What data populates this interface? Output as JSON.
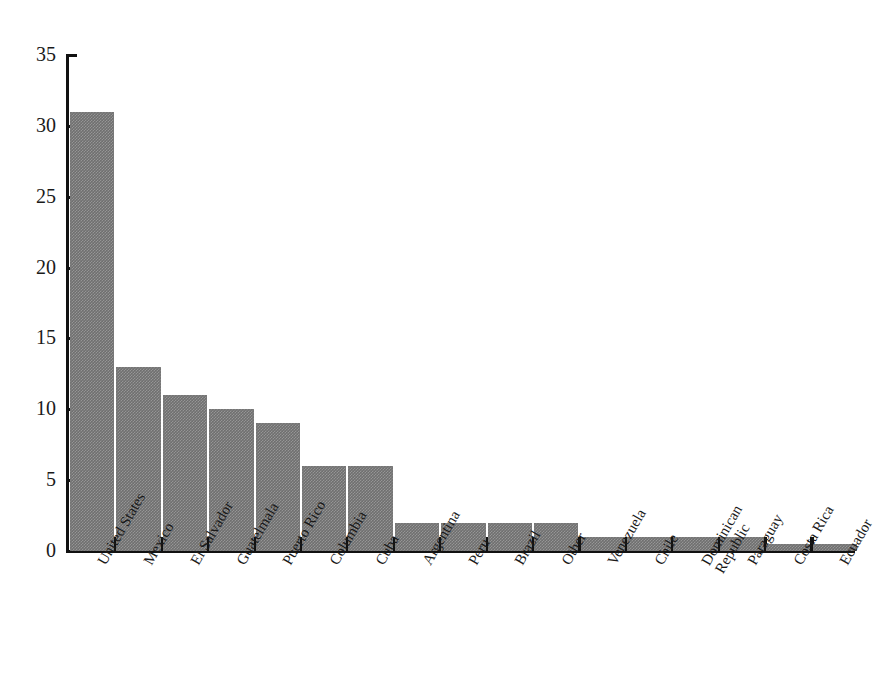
{
  "chart_data": {
    "type": "bar",
    "title": "",
    "subtitle": "",
    "xlabel": "",
    "ylabel": "",
    "ylim": [
      0,
      35
    ],
    "yticks": [
      0,
      5,
      10,
      15,
      20,
      25,
      30,
      35
    ],
    "ytick_labels": [
      "0",
      "5",
      "10",
      "15",
      "20",
      "25",
      "30",
      "35"
    ],
    "grid": false,
    "legend": false,
    "bar_color": "#6f6f6f",
    "axis_color": "#111111",
    "background": "#ffffff",
    "categories": [
      "United States",
      "Mexico",
      "El Salvador",
      "Guatelmala",
      "Puerto Rico",
      "Columbia",
      "Cuba",
      "Argentina",
      "Peru",
      "Brazil",
      "Other",
      "Venezuela",
      "Chile",
      "Dominican Republic",
      "Paraguay",
      "Costa Rica",
      "Ecuador"
    ],
    "category_label_lines": [
      [
        "United States"
      ],
      [
        "Mexico"
      ],
      [
        "El Salvador"
      ],
      [
        "Guatelmala"
      ],
      [
        "Puerto Rico"
      ],
      [
        "Columbia"
      ],
      [
        "Cuba"
      ],
      [
        "Argentina"
      ],
      [
        "Peru"
      ],
      [
        "Brazil"
      ],
      [
        "Other"
      ],
      [
        "Venezuela"
      ],
      [
        "Chile"
      ],
      [
        "Dominican",
        "Republic"
      ],
      [
        "Paraguay"
      ],
      [
        "Costa Rica"
      ],
      [
        "Ecuador"
      ]
    ],
    "values": [
      31,
      13,
      11,
      10,
      9,
      6,
      6,
      2,
      2,
      2,
      2,
      1,
      1,
      1,
      1,
      0.5,
      0.5
    ]
  }
}
